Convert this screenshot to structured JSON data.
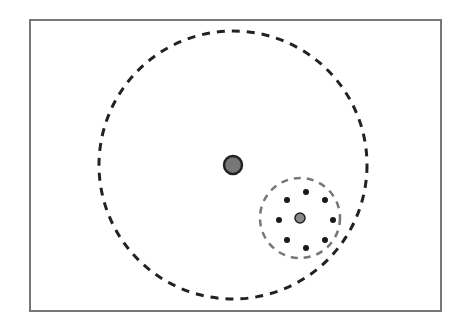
{
  "diagram": {
    "frame": {
      "x": 30,
      "y": 20,
      "width": 411,
      "height": 291,
      "stroke": "#777777"
    },
    "large_circle": {
      "cx": 233,
      "cy": 165,
      "r": 134,
      "stroke": "#222222",
      "dash": "8,7"
    },
    "large_center": {
      "cx": 233,
      "cy": 165,
      "r": 9,
      "fill": "#777777",
      "stroke": "#222222"
    },
    "small_circle": {
      "cx": 300,
      "cy": 218,
      "r": 40,
      "stroke": "#777777",
      "dash": "7,6"
    },
    "small_center": {
      "cx": 300,
      "cy": 218,
      "r": 5,
      "fill": "#888888",
      "stroke": "#222222"
    },
    "satellites": [
      {
        "cx": 306,
        "cy": 192
      },
      {
        "cx": 325,
        "cy": 200
      },
      {
        "cx": 333,
        "cy": 220
      },
      {
        "cx": 325,
        "cy": 240
      },
      {
        "cx": 306,
        "cy": 248
      },
      {
        "cx": 287,
        "cy": 240
      },
      {
        "cx": 279,
        "cy": 220
      },
      {
        "cx": 287,
        "cy": 200
      }
    ],
    "satellite_radius": 3,
    "satellite_color": "#1a1a1a"
  }
}
